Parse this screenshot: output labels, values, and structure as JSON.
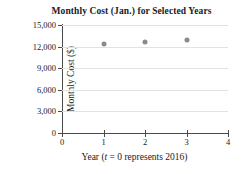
{
  "chart_data": {
    "type": "scatter",
    "title": "Monthly Cost (Jan.) for Selected Years",
    "xlabel": "Year (t = 0 represents 2016)",
    "xlabel_italic_var": "t",
    "xlabel_prefix": "Year (",
    "xlabel_suffix": " = 0 represents 2016)",
    "ylabel": "Monthly Cost ($)",
    "x": [
      1,
      2,
      3
    ],
    "values": [
      12350,
      12640,
      12920
    ],
    "xlim": [
      0,
      4
    ],
    "ylim": [
      0,
      15000
    ],
    "xticks": [
      "0",
      "1",
      "2",
      "3",
      "4"
    ],
    "xtick_values": [
      0,
      1,
      2,
      3,
      4
    ],
    "yticks": [
      "0",
      "3,000",
      "6,000",
      "9,000",
      "12,000",
      "15,000"
    ],
    "ytick_values": [
      0,
      3000,
      6000,
      9000,
      12000,
      15000
    ],
    "grid": true,
    "legend": null,
    "marker_color": "#8a8a8a",
    "axis_color": "#4a4a4a",
    "grid_color": "#e2e2e2"
  }
}
